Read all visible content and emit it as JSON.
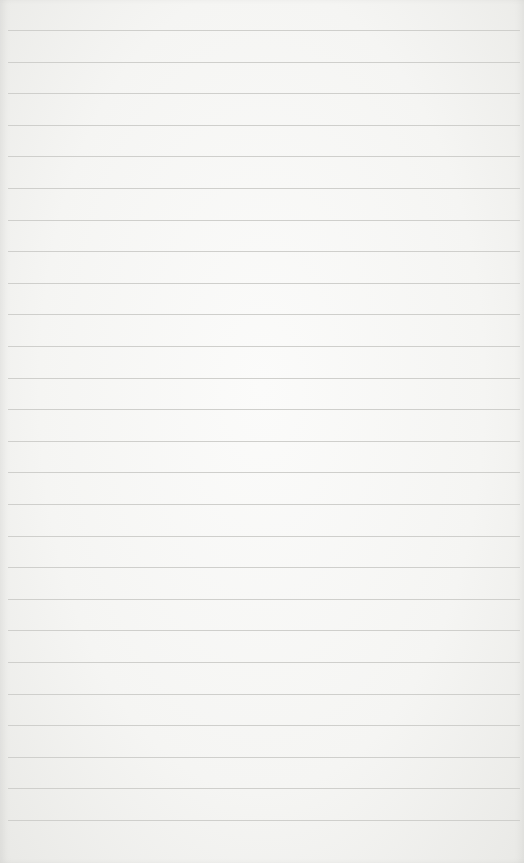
{
  "paper": {
    "type": "lined-paper",
    "line_color": "#cfcfcc",
    "background_color": "#f5f5f3",
    "first_line_y": 30,
    "line_spacing": 31.6,
    "line_count": 26
  }
}
